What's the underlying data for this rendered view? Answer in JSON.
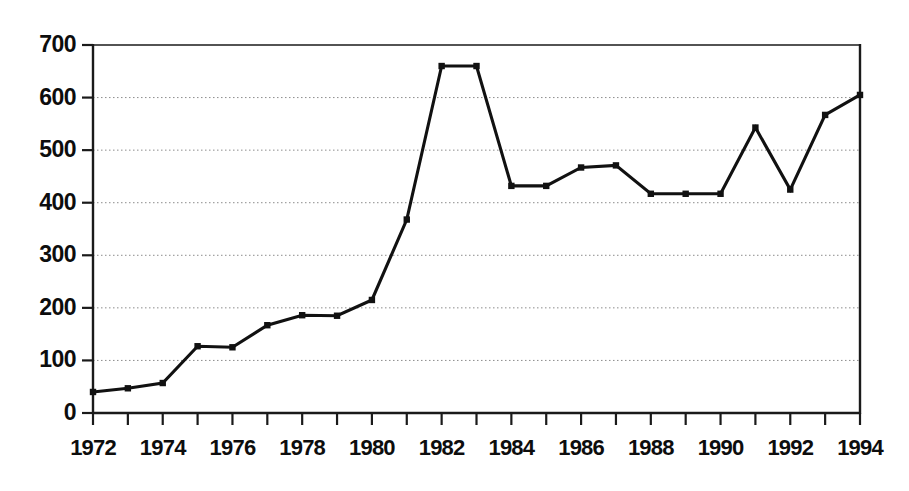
{
  "chart_data": {
    "type": "line",
    "title": "",
    "subtitle": "",
    "xlabel": "",
    "ylabel": "",
    "x": [
      1972,
      1973,
      1974,
      1975,
      1976,
      1977,
      1978,
      1979,
      1980,
      1981,
      1982,
      1983,
      1984,
      1985,
      1986,
      1987,
      1988,
      1989,
      1990,
      1991,
      1992,
      1993,
      1994
    ],
    "values": [
      40,
      47,
      57,
      127,
      125,
      167,
      186,
      185,
      215,
      368,
      660,
      660,
      432,
      432,
      467,
      471,
      417,
      417,
      417,
      543,
      425,
      567,
      605
    ],
    "series": [
      {
        "name": "",
        "values": [
          40,
          47,
          57,
          127,
          125,
          167,
          186,
          185,
          215,
          368,
          660,
          660,
          432,
          432,
          467,
          471,
          417,
          417,
          417,
          543,
          425,
          567,
          605
        ]
      }
    ],
    "xlim": [
      1972,
      1994
    ],
    "ylim": [
      0,
      700
    ],
    "x_tick_labels": [
      "1972",
      "1974",
      "1976",
      "1978",
      "1980",
      "1982",
      "1984",
      "1986",
      "1988",
      "1990",
      "1992",
      "1994"
    ],
    "x_tick_values": [
      1972,
      1974,
      1976,
      1978,
      1980,
      1982,
      1984,
      1986,
      1988,
      1990,
      1992,
      1994
    ],
    "x_minor_tick_values": [
      1973,
      1975,
      1977,
      1979,
      1981,
      1983,
      1985,
      1987,
      1989,
      1991,
      1993
    ],
    "y_tick_labels": [
      "0",
      "100",
      "200",
      "300",
      "400",
      "500",
      "600",
      "700"
    ],
    "y_tick_values": [
      0,
      100,
      200,
      300,
      400,
      500,
      600,
      700
    ],
    "grid": true,
    "grid_style": "dotted",
    "grid_axis": "y",
    "legend": false,
    "legend_position": "none",
    "marker": "square",
    "colors": {
      "line": "#111111",
      "marker": "#111111",
      "axis": "#1a1a1a",
      "grid": "#8c8c8c",
      "text": "#0d0d0d",
      "background": "#ffffff"
    }
  }
}
